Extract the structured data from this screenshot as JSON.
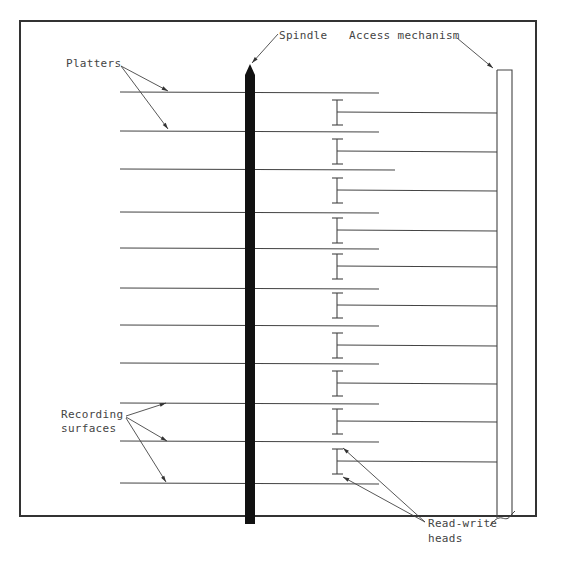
{
  "diagram": {
    "labels": {
      "platters": "Platters",
      "spindle": "Spindle",
      "access_mechanism": "Access mechanism",
      "recording_surfaces_line1": "Recording",
      "recording_surfaces_line2": "surfaces",
      "read_write_heads_line1": "Read-write",
      "read_write_heads_line2": "heads"
    },
    "platter_count": 11,
    "head_count": 10,
    "platter_y": [
      92,
      131,
      169,
      212,
      248,
      288,
      325,
      363,
      403,
      441,
      483
    ],
    "head_arm_y": [
      112,
      151,
      190,
      230,
      266,
      305,
      345,
      383,
      421,
      461
    ],
    "colors": {
      "line": "#444444",
      "spindle": "#111111",
      "frame": "#333333"
    }
  }
}
